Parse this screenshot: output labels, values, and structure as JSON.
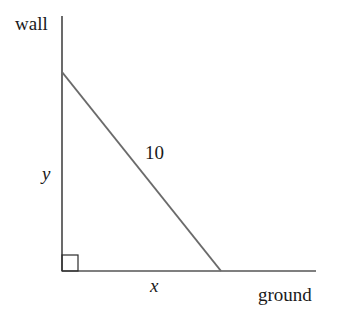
{
  "diagram": {
    "type": "ladder-against-wall right triangle",
    "labels": {
      "wall": "wall",
      "ground": "ground",
      "hypotenuse": "10",
      "vertical": "y",
      "horizontal": "x"
    },
    "colors": {
      "wall_line": "#2b2b2b",
      "ground_line": "#555555",
      "ladder_line": "#6b6b6b",
      "text": "#1a1a1a"
    },
    "geometry": {
      "wall": {
        "x": 62,
        "y1": 16,
        "y2": 271
      },
      "ground": {
        "y": 271,
        "x1": 62,
        "x2": 316
      },
      "ladder": {
        "x1": 62,
        "y1": 72,
        "x2": 221,
        "y2": 271
      },
      "right_angle_box": {
        "x": 62,
        "y": 255,
        "size": 16
      }
    }
  }
}
